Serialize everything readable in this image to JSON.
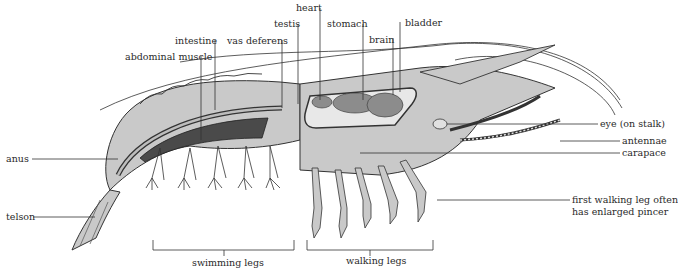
{
  "diagram": {
    "type": "labeled anatomical illustration",
    "top_labels": [
      {
        "id": "heart",
        "text": "heart"
      },
      {
        "id": "testis",
        "text": "testis"
      },
      {
        "id": "stomach",
        "text": "stomach"
      },
      {
        "id": "bladder",
        "text": "bladder"
      },
      {
        "id": "brain",
        "text": "brain"
      },
      {
        "id": "intestine",
        "text": "intestine"
      },
      {
        "id": "vas-deferens",
        "text": "vas deferens"
      },
      {
        "id": "abdominal-muscle",
        "text": "abdominal muscle"
      }
    ],
    "right_labels": [
      {
        "id": "eye",
        "text": "eye (on stalk)"
      },
      {
        "id": "antennae",
        "text": "antennae"
      },
      {
        "id": "carapace",
        "text": "carapace"
      },
      {
        "id": "first-walking-leg",
        "lines": [
          "first walking leg often",
          "has enlarged pincer"
        ]
      }
    ],
    "left_labels": [
      {
        "id": "anus",
        "text": "anus"
      },
      {
        "id": "telson",
        "text": "telson"
      }
    ],
    "bottom_brackets": [
      {
        "id": "swimming-legs",
        "text": "swimming legs"
      },
      {
        "id": "walking-legs",
        "text": "walking legs"
      }
    ],
    "colors": {
      "body": "#c9c9c9",
      "body_dark": "#9a9a9a",
      "muscle": "#4a4a4a",
      "organ": "#8c8c8c",
      "line": "#333333"
    }
  }
}
